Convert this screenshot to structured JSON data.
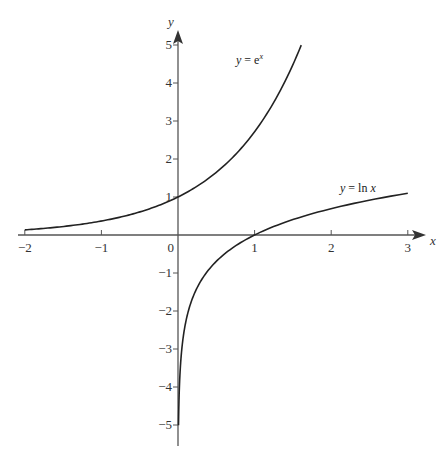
{
  "chart_data": {
    "type": "line",
    "title": "",
    "xlabel": "x",
    "ylabel": "y",
    "xlim": [
      -2,
      3
    ],
    "ylim": [
      -5,
      5
    ],
    "x_ticks": [
      -2,
      -1,
      0,
      1,
      2,
      3
    ],
    "x_tick_labels": [
      "−2",
      "−1",
      "0",
      "1",
      "2",
      "3"
    ],
    "y_ticks": [
      5,
      4,
      3,
      2,
      1,
      -1,
      -2,
      -3,
      -4,
      -5
    ],
    "y_tick_labels": [
      "5",
      "4",
      "3",
      "2",
      "1",
      "−1",
      "−2",
      "−3",
      "−4",
      "−5"
    ],
    "grid": false,
    "series": [
      {
        "name": "y = e^x",
        "label_text": "y = e",
        "label_sup": "x",
        "x": [
          -2,
          -1.5,
          -1,
          -0.5,
          0,
          0.5,
          1,
          1.25,
          1.5,
          1.609
        ],
        "values": [
          0.135,
          0.223,
          0.368,
          0.607,
          1,
          1.649,
          2.718,
          3.49,
          4.482,
          5
        ]
      },
      {
        "name": "y = ln x",
        "label_text": "y = ln x",
        "x": [
          0.0067,
          0.02,
          0.05,
          0.1,
          0.25,
          0.5,
          1,
          1.5,
          2,
          2.5,
          3
        ],
        "values": [
          -5,
          -3.91,
          -3.0,
          -2.303,
          -1.386,
          -0.693,
          0,
          0.405,
          0.693,
          0.916,
          1.099
        ]
      }
    ]
  },
  "axes": {
    "x_label": "x",
    "y_label": "y",
    "origin_label": "0"
  },
  "colors": {
    "axis": "#555555",
    "curve": "#222222",
    "text": "#333333"
  }
}
